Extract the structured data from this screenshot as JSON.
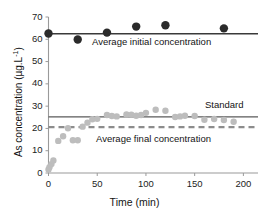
{
  "chart_data": {
    "type": "scatter",
    "title": "",
    "xlabel": "Time (min)",
    "ylabel": "As concentration (µg.L⁻¹)",
    "ylabel_base": "As concentration (µg.L",
    "ylabel_exp": "-1",
    "ylabel_tail": ")",
    "xlim": [
      0,
      215
    ],
    "ylim": [
      0,
      70
    ],
    "xticks": [
      0,
      50,
      100,
      150,
      200
    ],
    "yticks": [
      0,
      10,
      20,
      30,
      40,
      50,
      60,
      70
    ],
    "grid": false,
    "legend": "annotations-inline",
    "series": [
      {
        "name": "Initial concentration samples",
        "color": "#2b2b2b",
        "marker": "circle",
        "marker_size": 4.2,
        "points": [
          {
            "x": 0,
            "y": 62.6
          },
          {
            "x": 30,
            "y": 59.9
          },
          {
            "x": 60,
            "y": 63.0
          },
          {
            "x": 90,
            "y": 65.7
          },
          {
            "x": 120,
            "y": 66.3
          },
          {
            "x": 180,
            "y": 64.9
          }
        ]
      },
      {
        "name": "Final concentration samples",
        "color": "#bdbdbd",
        "marker": "circle",
        "marker_size": 3.2,
        "points": [
          {
            "x": 0,
            "y": 1.6
          },
          {
            "x": 1,
            "y": 2.6
          },
          {
            "x": 3,
            "y": 4.0
          },
          {
            "x": 5,
            "y": 5.6
          },
          {
            "x": 10,
            "y": 14.4
          },
          {
            "x": 15,
            "y": 16.5
          },
          {
            "x": 20,
            "y": 20.1
          },
          {
            "x": 25,
            "y": 14.7
          },
          {
            "x": 30,
            "y": 14.7
          },
          {
            "x": 35,
            "y": 20.8
          },
          {
            "x": 40,
            "y": 22.6
          },
          {
            "x": 45,
            "y": 24.1
          },
          {
            "x": 50,
            "y": 24.3
          },
          {
            "x": 60,
            "y": 26.0
          },
          {
            "x": 65,
            "y": 25.6
          },
          {
            "x": 70,
            "y": 25.4
          },
          {
            "x": 80,
            "y": 26.3
          },
          {
            "x": 85,
            "y": 26.2
          },
          {
            "x": 90,
            "y": 25.7
          },
          {
            "x": 95,
            "y": 26.0
          },
          {
            "x": 100,
            "y": 27.0
          },
          {
            "x": 110,
            "y": 28.4
          },
          {
            "x": 120,
            "y": 27.9
          },
          {
            "x": 130,
            "y": 25.1
          },
          {
            "x": 135,
            "y": 25.4
          },
          {
            "x": 140,
            "y": 25.7
          },
          {
            "x": 150,
            "y": 25.6
          },
          {
            "x": 160,
            "y": 23.9
          },
          {
            "x": 170,
            "y": 24.2
          },
          {
            "x": 180,
            "y": 23.8
          },
          {
            "x": 190,
            "y": 23.0
          }
        ]
      }
    ],
    "reference_lines": [
      {
        "name": "Average initial concentration",
        "label": "Average initial concentration",
        "value": 62.5,
        "style": "solid",
        "color": "#3a3a3a",
        "width": 1.6
      },
      {
        "name": "Standard",
        "label": "Standard",
        "value": 25.2,
        "style": "solid",
        "color": "#5a5a5a",
        "width": 1.3
      },
      {
        "name": "Average final concentration",
        "label": "Average final concentration",
        "value": 20.6,
        "style": "dashed",
        "color": "#8c8c8c",
        "width": 2.2
      }
    ],
    "axis_color": "#9a9a9a"
  },
  "annotations": {
    "initial": "Average initial concentration",
    "standard": "Standard",
    "final": "Average final concentration"
  },
  "ticks": {
    "y": [
      "70",
      "60",
      "50",
      "40",
      "30",
      "20",
      "10",
      "0"
    ],
    "x": [
      "0",
      "50",
      "100",
      "150",
      "200"
    ]
  }
}
